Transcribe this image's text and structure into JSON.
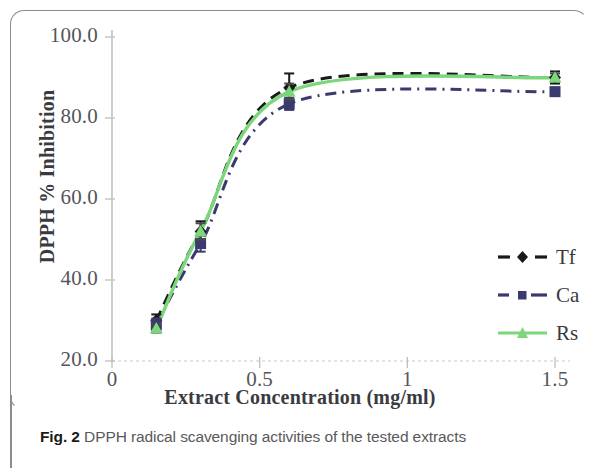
{
  "figure": {
    "caption_bold": "Fig. 2",
    "caption_text": " DPPH radical scavenging activities of the tested extracts"
  },
  "chart_data": {
    "type": "line",
    "title": "",
    "xlabel": "Extract Concentration (mg/ml)",
    "ylabel": "DPPH % Inhibition",
    "xlim": [
      0,
      1.5
    ],
    "ylim": [
      20.0,
      100.0
    ],
    "xticks": [
      "0",
      "0.5",
      "1",
      "1.5"
    ],
    "xtick_values": [
      0,
      0.5,
      1,
      1.5
    ],
    "yticks": [
      "20.0",
      "40.0",
      "60.0",
      "80.0",
      "100.0"
    ],
    "ytick_values": [
      20.0,
      40.0,
      60.0,
      80.0,
      100.0
    ],
    "grid": false,
    "legend_position": "right",
    "x": [
      0.15,
      0.3,
      0.6,
      1.5
    ],
    "series": [
      {
        "name": "Tf",
        "color": "#1a1a1a",
        "marker": "diamond",
        "linestyle": "dashed",
        "values": [
          30.0,
          52.0,
          87.5,
          90.0
        ],
        "errors": [
          1.5,
          2.5,
          3.5,
          1.5
        ]
      },
      {
        "name": "Ca",
        "color": "#3b3a6e",
        "marker": "square",
        "linestyle": "dash-dot",
        "values": [
          29.0,
          49.0,
          83.5,
          86.5
        ],
        "errors": [
          1.5,
          2.0,
          1.5,
          1.0
        ]
      },
      {
        "name": "Rs",
        "color": "#7cd67c",
        "marker": "triangle",
        "linestyle": "solid",
        "values": [
          28.0,
          52.0,
          86.5,
          90.0
        ],
        "errors": [
          1.0,
          2.0,
          2.0,
          1.0
        ]
      }
    ]
  }
}
